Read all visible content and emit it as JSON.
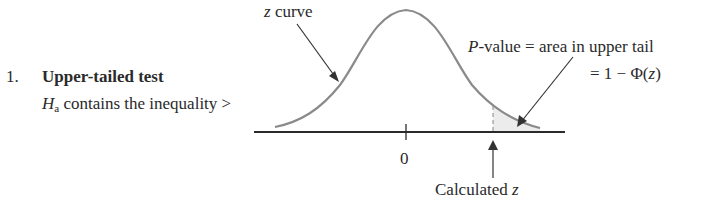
{
  "figure": {
    "item_number": "1.",
    "item_title": "Upper-tailed test",
    "hypothesis": {
      "symbol": "H",
      "subscript": "a",
      "text": " contains the inequality >"
    },
    "curve_label": {
      "variable": "z",
      "text": " curve"
    },
    "pvalue_annotation": {
      "line1_var": "P",
      "line1_text": "-value = area in upper tail",
      "line2_prefix": "= 1 −  Φ(",
      "line2_var": "z",
      "line2_suffix": ")"
    },
    "axis": {
      "center_tick_label": "0"
    },
    "calculated_label": {
      "text": "Calculated ",
      "variable": "z"
    },
    "colors": {
      "curve": "#8a8a8a",
      "axis": "#2a2a2a",
      "arrows": "#333333",
      "shaded_tail": "#ececec",
      "dashed_line": "#9a9a9a"
    }
  }
}
